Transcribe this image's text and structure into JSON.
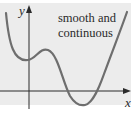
{
  "figure": {
    "annotation": {
      "line1": "smooth and",
      "line2": "continuous"
    },
    "axes": {
      "x_label": "x",
      "y_label": "y"
    },
    "colors": {
      "background": "#ececec",
      "curve": "#6e6e6e",
      "axis": "#2a2a2a",
      "text": "#2a2a2a"
    }
  }
}
